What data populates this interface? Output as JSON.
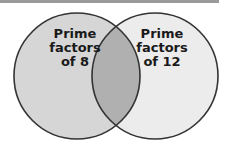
{
  "diagram": {
    "type": "venn",
    "sets": [
      {
        "id": "left",
        "label_lines": [
          "Prime",
          "factors",
          "of 8"
        ],
        "fill": "#d6d6d6"
      },
      {
        "id": "right",
        "label_lines": [
          "Prime",
          "factors",
          "of 12"
        ],
        "fill": "#ececec"
      }
    ],
    "intersection": {
      "fill": "#b0b0b0"
    },
    "outline_color": "#333333"
  }
}
